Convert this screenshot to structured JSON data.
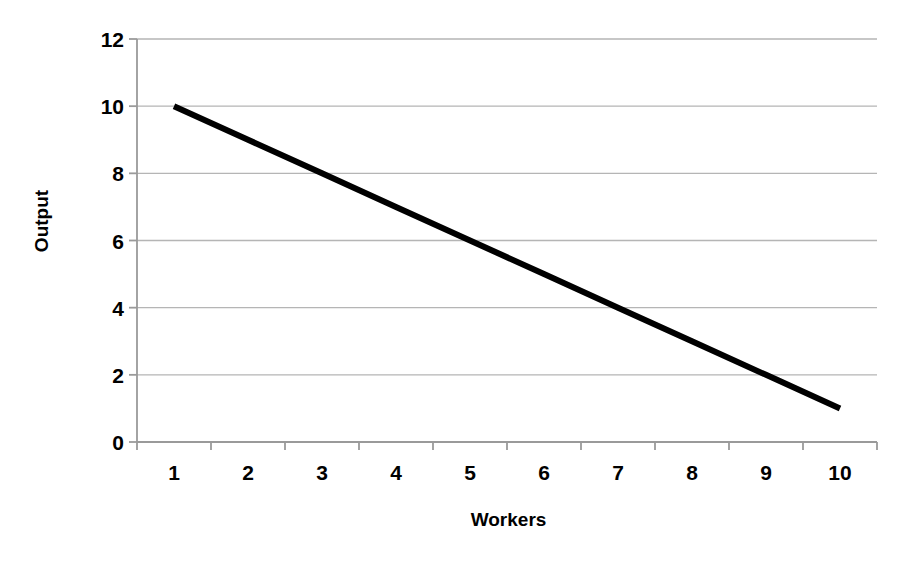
{
  "chart_data": {
    "type": "line",
    "title": "",
    "xlabel": "Workers",
    "ylabel": "Output",
    "categories": [
      "1",
      "2",
      "3",
      "4",
      "5",
      "6",
      "7",
      "8",
      "9",
      "10"
    ],
    "x": [
      1,
      2,
      3,
      4,
      5,
      6,
      7,
      8,
      9,
      10
    ],
    "series": [
      {
        "name": "Output",
        "values": [
          10,
          9,
          8,
          7,
          6,
          5,
          4,
          3,
          2,
          1
        ],
        "color": "#000000"
      }
    ],
    "ylim": [
      0,
      12
    ],
    "y_ticks": [
      0,
      2,
      4,
      6,
      8,
      10,
      12
    ],
    "y_tick_labels": [
      "0",
      "2",
      "4",
      "6",
      "8",
      "10",
      "12"
    ],
    "x_tick_labels": [
      "1",
      "2",
      "3",
      "4",
      "5",
      "6",
      "7",
      "8",
      "9",
      "10"
    ],
    "grid": "horizontal",
    "legend": "none",
    "background_color": "#ffffff",
    "gridline_color": "#b5b5b5",
    "axis_color": "#9a9a9a",
    "line_color": "#000000",
    "line_width": 6
  },
  "layout": {
    "plot_left": 137,
    "plot_right": 877,
    "plot_top": 39,
    "plot_bottom": 442
  }
}
